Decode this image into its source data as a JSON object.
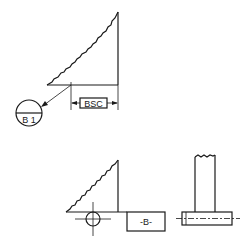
{
  "diagram": {
    "type": "engineering-drawing",
    "top_view": {
      "basic_dimension_label": "BSC",
      "datum_target_label": "B 1"
    },
    "bottom_view": {
      "datum_feature_label": "-B-"
    }
  }
}
